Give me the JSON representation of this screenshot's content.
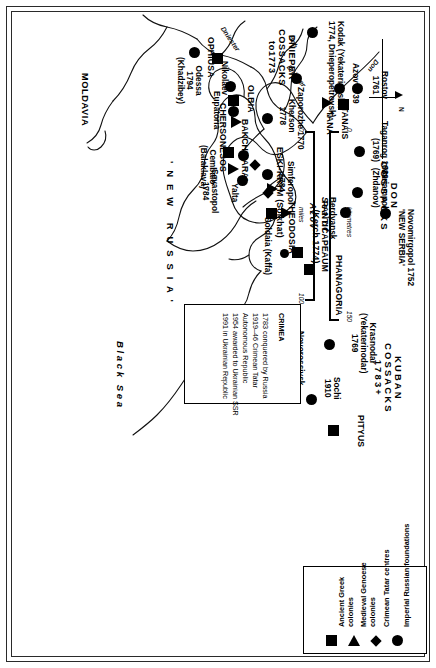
{
  "map": {
    "title_note_box": {
      "heading": "CRIMEA",
      "lines": [
        "1783 conquered by Russia",
        "1919–46 Crimean Tatar",
        "Autonomous Republic",
        "1954 awarded to Ukrainian SSR",
        "1991 in Ukrainian Republic"
      ]
    },
    "north_arrow": {
      "label": "N"
    },
    "scale": {
      "top_unit": "kilometres",
      "bottom_unit": "miles",
      "km_min": "0",
      "km_max": "150",
      "mi_min": "0",
      "mi_max": "100"
    },
    "seas": [
      {
        "name": "Sea of",
        "name2": "Azov"
      },
      {
        "name": "Black Sea"
      }
    ],
    "regions": [
      {
        "label": "DON\nCOSSACKS"
      },
      {
        "label": "KUBAN\nCOSSACKS\n1783+"
      },
      {
        "label": "DNIEPER\nCOSSACKS\nto1773"
      },
      {
        "label": "' N E W   R U S S I A '"
      },
      {
        "label": "MOLDAVIA"
      }
    ],
    "rivers": [
      {
        "name": "Don"
      },
      {
        "name": "Bch"
      },
      {
        "name": "Dnieper"
      },
      {
        "name": "Dniester"
      }
    ],
    "places": [
      {
        "name": "Kodak (Yekaterinoslav\n1774, Dnieperopetrovsk)",
        "type": "imperial-russian-foundation"
      },
      {
        "name": "Zaporozhe 1770",
        "type": "imperial-russian-foundation"
      },
      {
        "name": "Novomirgopol 1752\n'NEW SERBIA'",
        "type": "imperial-russian-foundation"
      },
      {
        "name": "Mariampol\n(Zhdanov)",
        "type": "imperial-russian-foundation"
      },
      {
        "name": "Berdyansk",
        "type": "imperial-russian-foundation"
      },
      {
        "name": "Taganrog 1689\n(1769)",
        "type": "imperial-russian-foundation"
      },
      {
        "name": "Rostov\n1761",
        "type": "imperial-russian-foundation"
      },
      {
        "name": "Azov 1739",
        "type": "imperial-russian-foundation"
      },
      {
        "name": "TANAIS",
        "type": "ancient-greek-colony"
      },
      {
        "name": "TANA",
        "type": "medieval-genoese-colony"
      },
      {
        "name": "Krasnodar\n(Yekaterinodar)\n1769",
        "type": "imperial-russian-foundation"
      },
      {
        "name": "Novorossiysk\n1881",
        "type": "imperial-russian-foundation"
      },
      {
        "name": "Sochi\n1910",
        "type": "imperial-russian-foundation"
      },
      {
        "name": "PITYUS",
        "type": "ancient-greek-colony"
      },
      {
        "name": "PHANAGORIA",
        "type": "ancient-greek-colony"
      },
      {
        "name": "PANTICAPEAUM\n(Kerch 1774)",
        "type": "ancient-greek-colony"
      },
      {
        "name": "THEODOSIA",
        "type": "ancient-greek-colony"
      },
      {
        "name": "Soldaia (Kaffa)",
        "type": "medieval-genoese-colony"
      },
      {
        "name": "ESKI-KRYM (Solkhat)",
        "type": "crimean-tatar-centre"
      },
      {
        "name": "Simferopol\n1784",
        "type": "imperial-russian-foundation"
      },
      {
        "name": "Yalta",
        "type": "imperial-russian-foundation"
      },
      {
        "name": "Sevastopol\n1784",
        "type": "imperial-russian-foundation"
      },
      {
        "name": "Cembalo\n(Balaklava)",
        "type": "medieval-genoese-colony"
      },
      {
        "name": "BAKCHISARAI",
        "type": "crimean-tatar-centre"
      },
      {
        "name": "CHERSONESOS",
        "type": "ancient-greek-colony"
      },
      {
        "name": "Eupatoria",
        "type": "imperial-russian-foundation"
      },
      {
        "name": "Kherson\n1778",
        "type": "imperial-russian-foundation"
      },
      {
        "name": "OLBIA",
        "type": "ancient-greek-colony"
      },
      {
        "name": "Nikolaev",
        "type": "imperial-russian-foundation"
      },
      {
        "name": "OPHIUSA",
        "type": "ancient-greek-colony"
      },
      {
        "name": "Odessa\n1794\n(Khadzibey)",
        "type": "imperial-russian-foundation"
      }
    ],
    "legend": {
      "items": [
        {
          "symbol": "square",
          "label": "Ancient Greek\ncolonies"
        },
        {
          "symbol": "triangle",
          "label": "Medieval Genoese\ncolonies"
        },
        {
          "symbol": "diamond",
          "label": "Crimean Tatar centres"
        },
        {
          "symbol": "circle",
          "label": "Imperial Russian foundations"
        }
      ]
    }
  }
}
